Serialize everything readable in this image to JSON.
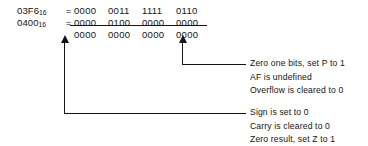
{
  "diagram": {
    "calculation": {
      "rows": [
        {
          "hex": "03F6",
          "base": "16",
          "equals": "=",
          "nibbles": [
            "0000",
            "0011",
            "1111",
            "0110"
          ]
        },
        {
          "hex": "0400",
          "base": "16",
          "equals": "=",
          "nibbles": [
            "0000",
            "0100",
            "0000",
            "0000"
          ]
        },
        {
          "hex": "",
          "base": "",
          "equals": "",
          "nibbles": [
            "0000",
            "0000",
            "0000",
            "0000"
          ]
        }
      ]
    },
    "annotations": [
      {
        "id": "upper",
        "lines": [
          "Zero one bits, set P to 1",
          "AF is undefined",
          "Overflow is cleared to 0"
        ]
      },
      {
        "id": "lower",
        "lines": [
          "Sign is set to 0",
          "Carry is cleared to 0",
          "Zero result, set Z to 1"
        ]
      }
    ],
    "colors": {
      "ink": "#141414",
      "background": "#ffffff"
    }
  }
}
